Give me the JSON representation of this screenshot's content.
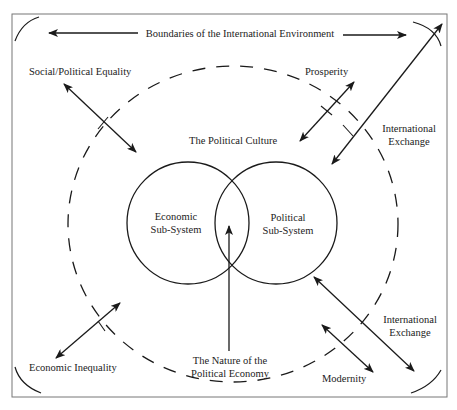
{
  "title": "Boundaries of the International Environment",
  "labels": {
    "boundaries": "Boundaries of the International Environment",
    "social_political_equality": "Social/Political  Equality",
    "prosperity": "Prosperity",
    "political_culture": "The Political Culture",
    "international_exchange_top_1": "International",
    "international_exchange_top_2": "Exchange",
    "economic_subsystem_1": "Economic",
    "economic_subsystem_2": "Sub-System",
    "political_subsystem_1": "Political",
    "political_subsystem_2": "Sub-System",
    "international_exchange_bottom_1": "International",
    "international_exchange_bottom_2": "Exchange",
    "economic_inequality": "Economic Inequality",
    "nature_political_economy_1": "The Nature of the",
    "nature_political_economy_2": "Political Economy",
    "modernity": "Modernity"
  },
  "colors": {
    "line": "#1a1a1a",
    "border": "#777777",
    "text": "#222222"
  }
}
